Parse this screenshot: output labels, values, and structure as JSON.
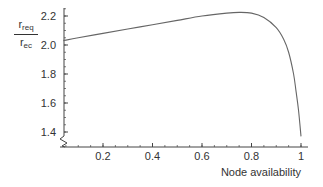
{
  "chart_data": {
    "type": "line",
    "title": "",
    "xlabel": "Node availability",
    "ylabel": {
      "numerator": "r",
      "numerator_sub": "req",
      "denominator": "r",
      "denominator_sub": "ec"
    },
    "xlim": [
      0,
      1.03
    ],
    "ylim": [
      1.33,
      2.25
    ],
    "y_axis_break": true,
    "grid": false,
    "legend": null,
    "x_ticks": [
      0.2,
      0.4,
      0.6,
      0.8,
      1
    ],
    "x_tick_labels": [
      "0.2",
      "0.4",
      "0.6",
      "0.8",
      "1"
    ],
    "y_ticks": [
      1.4,
      1.6,
      1.8,
      2.0,
      2.2
    ],
    "y_tick_labels": [
      "1.4",
      "1.6",
      "1.8",
      "2.0",
      "2.2"
    ],
    "series": [
      {
        "name": "r_req / r_ec",
        "color": "#666666",
        "x": [
          0.04,
          0.1,
          0.2,
          0.3,
          0.4,
          0.5,
          0.6,
          0.7,
          0.75,
          0.8,
          0.85,
          0.9,
          0.93,
          0.95,
          0.97,
          0.98,
          0.99,
          1.0
        ],
        "y": [
          2.03,
          2.05,
          2.08,
          2.11,
          2.14,
          2.17,
          2.2,
          2.22,
          2.225,
          2.22,
          2.19,
          2.12,
          2.04,
          1.95,
          1.8,
          1.68,
          1.55,
          1.37
        ]
      }
    ]
  }
}
